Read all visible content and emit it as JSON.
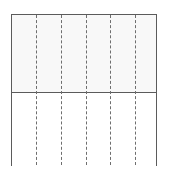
{
  "figure": {
    "name": "divided-rectangle",
    "canvas": {
      "width": 169,
      "height": 175,
      "background_color": "#ffffff"
    },
    "frame": {
      "x": 11,
      "y": 14,
      "width": 146,
      "height": 152,
      "border_color": "#5b5b5b",
      "border_width": 1.4
    },
    "bands": [
      {
        "label": "upper-band",
        "y": 14,
        "height": 78,
        "fill_color": "#f8f8f8"
      },
      {
        "label": "lower-band",
        "y": 92,
        "height": 74,
        "fill_color": "#ffffff"
      }
    ],
    "horizontal_divider": {
      "y": 92,
      "color": "#5b5b5b",
      "width": 1.4
    },
    "dashed_lines": {
      "count": 5,
      "color": "#6e6e6e",
      "width": 1.6,
      "style": "dashed",
      "dash_length": 5,
      "gap_length": 3,
      "positions": [
        24,
        49,
        73.5,
        98,
        122.5
      ]
    }
  }
}
